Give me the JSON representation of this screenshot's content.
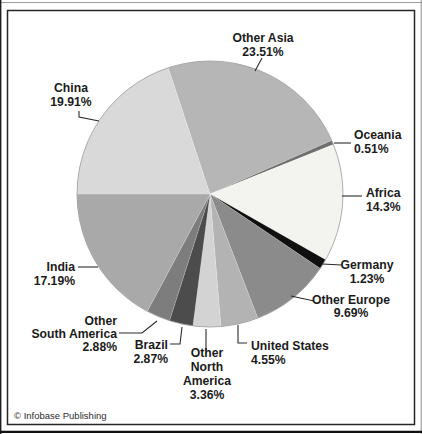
{
  "chart_data": {
    "type": "pie",
    "direction": "clockwise",
    "start_angle_deg": -18.33,
    "total_percent": 100.0,
    "legend": "none",
    "slices": [
      {
        "label": "Other Asia",
        "value": 23.51,
        "display": "23.51%",
        "color": "#b6b6b6",
        "label_lines": [
          "Other Asia",
          "23.51%"
        ]
      },
      {
        "label": "Oceania",
        "value": 0.51,
        "display": "0.51%",
        "color": "#6f6f6f",
        "label_lines": [
          "Oceania",
          "0.51%"
        ]
      },
      {
        "label": "Africa",
        "value": 14.3,
        "display": "14.3%",
        "color": "#f3f3ef",
        "label_lines": [
          "Africa",
          "14.3%"
        ]
      },
      {
        "label": "Germany",
        "value": 1.23,
        "display": "1.23%",
        "color": "#101010",
        "label_lines": [
          "Germany",
          "1.23%"
        ]
      },
      {
        "label": "Other Europe",
        "value": 9.69,
        "display": "9.69%",
        "color": "#8b8b8b",
        "label_lines": [
          "Other Europe",
          "9.69%"
        ]
      },
      {
        "label": "United States",
        "value": 4.55,
        "display": "4.55%",
        "color": "#b3b3b3",
        "label_lines": [
          "United States",
          "4.55%"
        ]
      },
      {
        "label": "Other North America",
        "value": 3.36,
        "display": "3.36%",
        "color": "#d3d3d3",
        "label_lines": [
          "Other",
          "North",
          "America",
          "3.36%"
        ]
      },
      {
        "label": "Brazil",
        "value": 2.87,
        "display": "2.87%",
        "color": "#4c4c4c",
        "label_lines": [
          "Brazil",
          "2.87%"
        ]
      },
      {
        "label": "Other South America",
        "value": 2.88,
        "display": "2.88%",
        "color": "#7d7d7d",
        "label_lines": [
          "Other",
          "South America",
          "2.88%"
        ]
      },
      {
        "label": "India",
        "value": 17.19,
        "display": "17.19%",
        "color": "#a9a9a9",
        "label_lines": [
          "India",
          "17.19%"
        ]
      },
      {
        "label": "China",
        "value": 19.91,
        "display": "19.91%",
        "color": "#d9d9d9",
        "label_lines": [
          "China",
          "19.91%"
        ]
      }
    ]
  },
  "footer": {
    "credit": "© Infobase Publishing"
  },
  "frame": {
    "background": "#ffffff",
    "border_color": "#262626",
    "edge_line_color": "#1a1a1a",
    "circle_outline_color": "#999999"
  }
}
